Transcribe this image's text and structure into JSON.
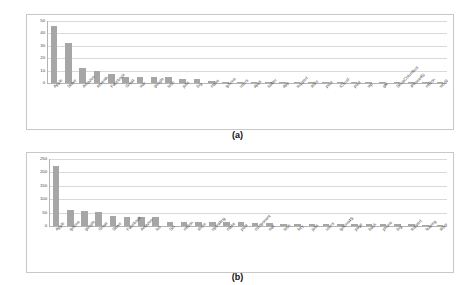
{
  "figure": {
    "caption_a": "(a)",
    "caption_b": "(b)"
  },
  "chart_data": [
    {
      "type": "bar",
      "id": "chart-a",
      "title": "",
      "subtitle": "(a)",
      "xlabel": "",
      "ylabel": "",
      "ylim": [
        0,
        50
      ],
      "yticks": [
        0,
        10,
        20,
        30,
        40,
        50
      ],
      "ytick_labels": [
        "0",
        "10",
        "20",
        "30",
        "40",
        "50"
      ],
      "grid": true,
      "legend": "none",
      "bar_color": "#a6a6a6",
      "categories": [
        "Apple",
        "Steve",
        "Amazon",
        "seventh",
        "Facebook",
        "Great",
        "war",
        "google",
        "tech",
        "jobs",
        "big",
        "make",
        "iphone",
        "users",
        "apps",
        "twitter",
        "app",
        "support",
        "store",
        "post",
        "iCloud",
        "post",
        "wp",
        "gtv",
        "ShopColumbus",
        "iPhone4S",
        "million",
        "world"
      ],
      "values": [
        46,
        32,
        12,
        10,
        7,
        5,
        5,
        5,
        5,
        3,
        3,
        2,
        1.2,
        1.2,
        1.2,
        1.2,
        0.7,
        0.9,
        0.9,
        0.8,
        0.9,
        0.6,
        0.5,
        0.4,
        0.3,
        0.3,
        0.3,
        0.3
      ]
    },
    {
      "type": "bar",
      "id": "chart-b",
      "title": "",
      "subtitle": "(b)",
      "xlabel": "",
      "ylabel": "",
      "ylim": [
        0,
        250
      ],
      "yticks": [
        0,
        50,
        100,
        150,
        200,
        250
      ],
      "ytick_labels": [
        "0",
        "50",
        "100",
        "150",
        "200",
        "250"
      ],
      "grid": true,
      "legend": "none",
      "bar_color": "#a6a6a6",
      "categories": [
        "Apple",
        "iphone",
        "google",
        "Great",
        "Steve",
        "Facebook",
        "Amazon",
        "ios",
        "Siri",
        "million",
        "show",
        "operating",
        "make",
        "post",
        "component",
        "war",
        "tech",
        "key",
        "jobs",
        "users",
        "iphone4S",
        "page",
        "back",
        "phone",
        "big",
        "support",
        "leaving",
        "store"
      ],
      "values": [
        225,
        58,
        57,
        53,
        36,
        32,
        32,
        32,
        15,
        15,
        14,
        14,
        14,
        14,
        12,
        10,
        9,
        9,
        9,
        9,
        8,
        8,
        8,
        7,
        7,
        6,
        5,
        5
      ]
    }
  ]
}
